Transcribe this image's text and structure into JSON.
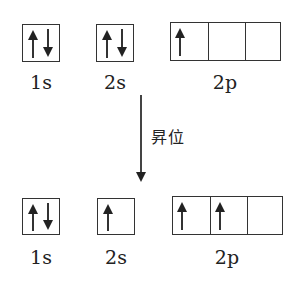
{
  "diagram": {
    "type": "orbital-box-diagram",
    "transition_label": "昇位",
    "ground_state": {
      "orbitals": [
        {
          "label": "1s",
          "cells": [
            [
              "up",
              "down"
            ]
          ]
        },
        {
          "label": "2s",
          "cells": [
            [
              "up",
              "down"
            ]
          ]
        },
        {
          "label": "2p",
          "cells": [
            [
              "up"
            ],
            [],
            []
          ]
        }
      ]
    },
    "excited_state": {
      "orbitals": [
        {
          "label": "1s",
          "cells": [
            [
              "up",
              "down"
            ]
          ]
        },
        {
          "label": "2s",
          "cells": [
            [
              "up"
            ]
          ]
        },
        {
          "label": "2p",
          "cells": [
            [
              "up"
            ],
            [
              "up"
            ],
            []
          ]
        }
      ]
    }
  },
  "labels": {
    "top_1s": "1s",
    "top_2s": "2s",
    "top_2p": "2p",
    "bottom_1s": "1s",
    "bottom_2s": "2s",
    "bottom_2p": "2p"
  }
}
